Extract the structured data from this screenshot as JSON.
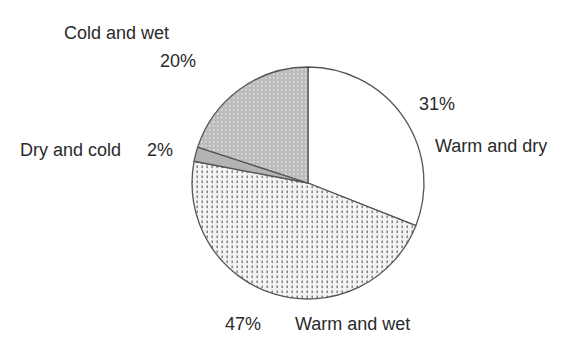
{
  "chart_data": {
    "type": "pie",
    "title": "",
    "start_angle": "12 o'clock",
    "direction": "clockwise",
    "slices": [
      {
        "label": "Warm and dry",
        "value": 31,
        "display": "31%",
        "fill": "white"
      },
      {
        "label": "Warm and wet",
        "value": 47,
        "display": "47%",
        "fill": "dotted light"
      },
      {
        "label": "Dry and cold",
        "value": 2,
        "display": "2%",
        "fill": "solid gray"
      },
      {
        "label": "Cold and wet",
        "value": 20,
        "display": "20%",
        "fill": "dotted gray"
      }
    ],
    "categories": [
      "Warm and dry",
      "Warm and wet",
      "Dry and cold",
      "Cold and wet"
    ],
    "values": [
      31,
      47,
      2,
      20
    ],
    "legend": "none (direct labels)"
  },
  "labels": {
    "cold_wet_name": "Cold and wet",
    "cold_wet_pct": "20%",
    "dry_cold_name": "Dry and cold",
    "dry_cold_pct": "2%",
    "warm_dry_pct": "31%",
    "warm_dry_name": "Warm and dry",
    "warm_wet_pct": "47%",
    "warm_wet_name": "Warm and wet"
  },
  "colors": {
    "outline": "#555555",
    "warm_dry": "#ffffff",
    "warm_wet_bg": "#f4f4f4",
    "warm_wet_dot": "#777777",
    "dry_cold": "#b5b5b5",
    "cold_wet_bg": "#bdbdbd",
    "cold_wet_dot": "#e6e6e6"
  }
}
